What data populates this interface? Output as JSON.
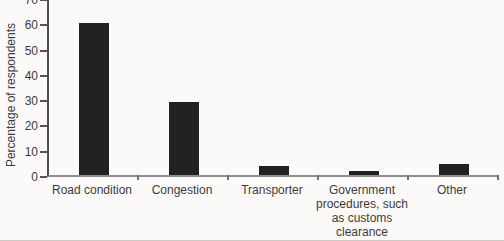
{
  "chart_data": {
    "type": "bar",
    "title": "",
    "xlabel": "",
    "ylabel": "Percentage of respondents",
    "categories": [
      "Road condition",
      "Congestion",
      "Transporter",
      "Government procedures, such as customs clearance",
      "Other"
    ],
    "values": [
      60,
      29,
      3.5,
      1.5,
      4.5
    ],
    "ylim": [
      0,
      70
    ],
    "ytick_interval": 10,
    "ytick_labels": [
      "0",
      "10",
      "20",
      "30",
      "40",
      "50",
      "60",
      "70"
    ],
    "grid": false,
    "legend": "none",
    "bar_color": "#222222",
    "y_axis_color": "#4f4f4f",
    "x_axis_color": "#8f8f8f",
    "text_color": "#3b3b3b",
    "background_color": "#fbfaf8"
  }
}
